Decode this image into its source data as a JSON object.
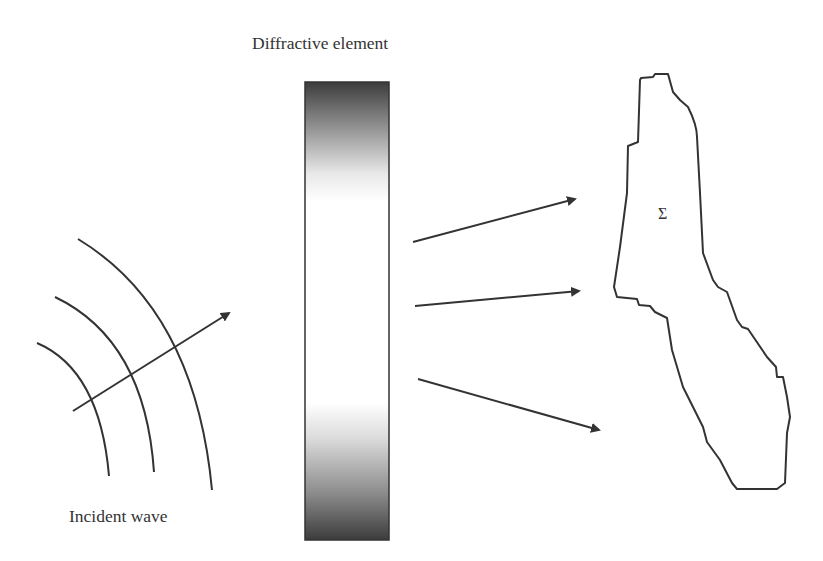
{
  "diagram": {
    "title": "Diffractive element",
    "labels": {
      "diffractive_element": "Diffractive element",
      "incident_wave": "Incident wave",
      "target_region": "Σ"
    },
    "colors": {
      "stroke": "#333333",
      "element_dark": "#3a3a3a",
      "element_light": "#ffffff",
      "background": "#ffffff"
    },
    "components": [
      {
        "id": "incident-wavefronts",
        "type": "arcs",
        "count": 3
      },
      {
        "id": "incident-arrow",
        "type": "arrow"
      },
      {
        "id": "diffractive-element",
        "type": "gradient-bar"
      },
      {
        "id": "diffracted-arrows",
        "type": "arrow",
        "count": 3
      },
      {
        "id": "target-region",
        "type": "irregular-outline",
        "label": "Σ"
      }
    ]
  }
}
